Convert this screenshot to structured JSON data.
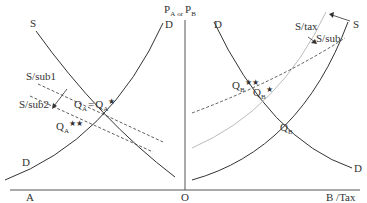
{
  "axes": {
    "vertical_label_main": "P",
    "vertical_label_sub_a": "A",
    "vertical_label_or": "or",
    "vertical_label_main_b": "P",
    "vertical_label_sub_b": "B",
    "origin_label": "O",
    "left_axis_label": "A",
    "right_axis_label": "B /Tax"
  },
  "left_panel": {
    "supply_label": "S",
    "demand_top_label": "D",
    "demand_bottom_label": "D",
    "sub1_label": "S/sub1",
    "sub2_label": "S/sub2",
    "eq_label_main": "Q",
    "eq_label_sub": "A",
    "eq_label_equals": "=",
    "eq_label_star_main": "Q",
    "eq_label_star_sub": "A",
    "eq_label_star": "★",
    "eq2_label_main": "Q",
    "eq2_label_sub": "A",
    "eq2_label_stars": "★★"
  },
  "right_panel": {
    "supply_label": "S",
    "demand_top_label": "D",
    "demand_bottom_label": "D",
    "tax_label": "S/tax",
    "sub_label": "S/sub",
    "eq_label_main": "Q",
    "eq_label_sub": "B",
    "eq_star_main": "Q",
    "eq_star_sub": "B",
    "eq_star": "★",
    "eq2_main": "Q",
    "eq2_sub": "B",
    "eq2_stars": "★★"
  },
  "colors": {
    "line": "#333333",
    "light_line": "#aaaaaa",
    "axis": "#555555"
  }
}
